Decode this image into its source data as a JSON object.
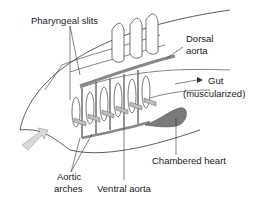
{
  "diagram": {
    "labels": {
      "pharyngeal_slits": "Pharyngeal slits",
      "dorsal_aorta_1": "Dorsal",
      "dorsal_aorta_2": "aorta",
      "gut_1": "Gut",
      "gut_2": "(muscularized)",
      "chambered_heart": "Chambered heart",
      "aortic_arches_1": "Aortic",
      "aortic_arches_2": "arches",
      "ventral_aorta": "Ventral aorta"
    },
    "colors": {
      "line": "#333333",
      "vessel": "#888888",
      "heart": "#7a7a7a",
      "arrow": "#bdbdbd"
    }
  }
}
